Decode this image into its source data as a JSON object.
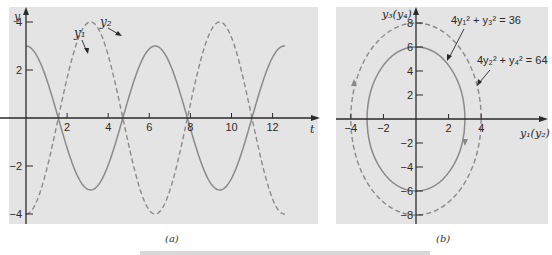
{
  "chart_data": [
    {
      "type": "line",
      "panel_label": "(a)",
      "xlabel": "t",
      "ylabel": "y",
      "xlim": [
        0,
        14
      ],
      "ylim": [
        -4.4,
        4.6
      ],
      "x_ticks": [
        2,
        4,
        6,
        8,
        10,
        12
      ],
      "y_ticks": [
        4,
        2,
        -2,
        -4
      ],
      "grid": false,
      "series": [
        {
          "name": "y1",
          "label": "y₁",
          "style": "solid",
          "formula": "3 cos t",
          "amplitude": 3,
          "t_range": [
            0,
            12.6
          ]
        },
        {
          "name": "y2",
          "label": "y₂",
          "style": "dashed",
          "formula": "-4 cos t",
          "amplitude": 4,
          "t_range": [
            0,
            12.6
          ]
        }
      ]
    },
    {
      "type": "line",
      "panel_label": "(b)",
      "xlabel": "y₁(y₂)",
      "ylabel": "y₃(y₄)",
      "xlim": [
        -5,
        8
      ],
      "ylim": [
        -8.6,
        9
      ],
      "x_ticks": [
        -4,
        -2,
        2,
        4
      ],
      "y_ticks": [
        8,
        6,
        4,
        2,
        -2,
        -4,
        -6,
        -8
      ],
      "grid": false,
      "series": [
        {
          "name": "inner-ellipse",
          "label": "4y₁² + y₃² = 36",
          "style": "solid",
          "semi_axis_x": 3,
          "semi_axis_y": 6
        },
        {
          "name": "outer-ellipse",
          "label": "4y₂² + y₄² = 64",
          "style": "dashed",
          "semi_axis_x": 4,
          "semi_axis_y": 8
        }
      ]
    }
  ],
  "panel_a": {
    "xlabel": "t",
    "ylabel": "y",
    "x_ticks": [
      "2",
      "4",
      "6",
      "8",
      "10",
      "12"
    ],
    "y_ticks": [
      "4",
      "2",
      "-2",
      "-4"
    ],
    "label_y1": "y₁",
    "label_y2": "y₂",
    "caption": "(a)"
  },
  "panel_b": {
    "xlabel": "y₁(y₂)",
    "ylabel": "y₃(y₄)",
    "x_ticks": [
      "-4",
      "-2",
      "2",
      "4"
    ],
    "y_ticks": [
      "8",
      "6",
      "4",
      "2",
      "-2",
      "-4",
      "-6",
      "-8"
    ],
    "eq_inner": "4y₁² + y₃² = 36",
    "eq_outer": "4y₂² + y₄² = 64",
    "caption": "(b)"
  },
  "colors": {
    "panel_bg": "#e4e4e4",
    "axis": "#2a2a2a",
    "curve": "#8a8a8a"
  }
}
